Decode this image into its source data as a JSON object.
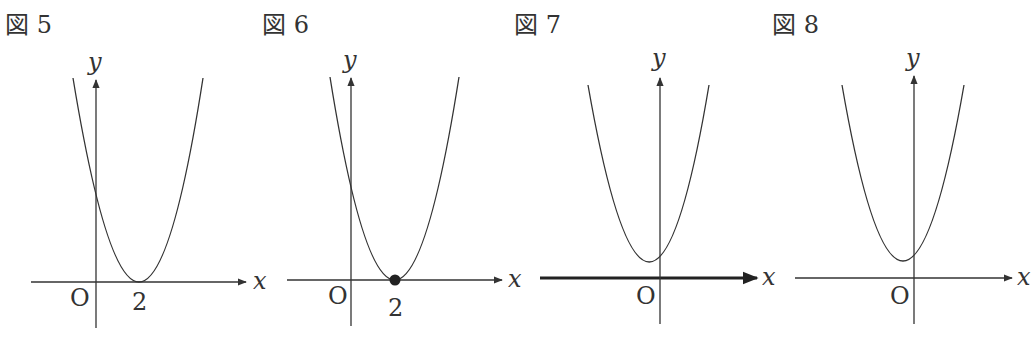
{
  "figures": [
    {
      "id": "fig5",
      "label": "図 5",
      "axis_x_label": "x",
      "axis_y_label": "y",
      "origin_label": "O",
      "tick_label": "2",
      "description": "Parabola tangent to x-axis at x = 2, y-intercept positive",
      "vertex_marked": false,
      "x_axis_bold": false
    },
    {
      "id": "fig6",
      "label": "図 6",
      "axis_x_label": "x",
      "axis_y_label": "y",
      "origin_label": "O",
      "tick_label": "2",
      "description": "Parabola tangent to x-axis at x = 2, vertex marked with filled dot",
      "vertex_marked": true,
      "x_axis_bold": false
    },
    {
      "id": "fig7",
      "label": "図 7",
      "axis_x_label": "x",
      "axis_y_label": "y",
      "origin_label": "O",
      "description": "Parabola entirely above x-axis, vertex slightly left of y-axis; x-axis drawn bold",
      "vertex_marked": false,
      "x_axis_bold": true
    },
    {
      "id": "fig8",
      "label": "図 8",
      "axis_x_label": "x",
      "axis_y_label": "y",
      "origin_label": "O",
      "description": "Parabola entirely above x-axis, vertex slightly left of y-axis",
      "vertex_marked": false,
      "x_axis_bold": false
    }
  ],
  "colors": {
    "ink": "#333333",
    "background": "#ffffff"
  }
}
